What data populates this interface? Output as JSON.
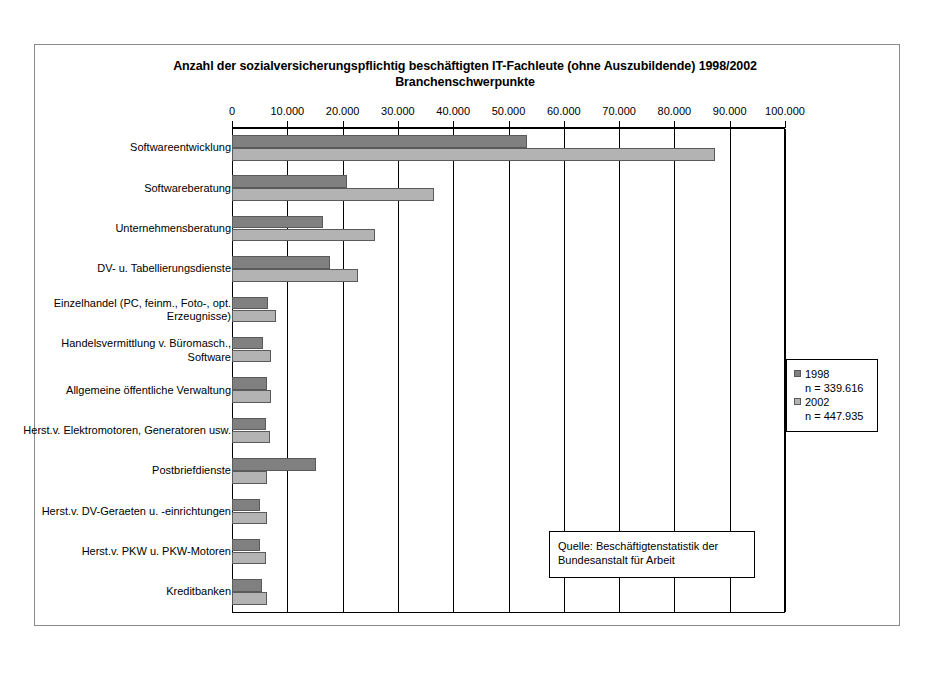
{
  "chart_data": {
    "type": "bar",
    "orientation": "horizontal",
    "title": "Anzahl der sozialversicherungspflichtig beschäftigten IT-Fachleute (ohne Auszubildende) 1998/2002",
    "subtitle": "Branchenschwerpunkte",
    "xlabel": "",
    "ylabel": "",
    "xlim": [
      0,
      100000
    ],
    "xtick_step": 10000,
    "grid": true,
    "tick_labels": [
      "0",
      "10.000",
      "20.000",
      "30.000",
      "40.000",
      "50.000",
      "60.000",
      "70.000",
      "80.000",
      "90.000",
      "100.000"
    ],
    "tick_values": [
      0,
      10000,
      20000,
      30000,
      40000,
      50000,
      60000,
      70000,
      80000,
      90000,
      100000
    ],
    "categories": [
      "Softwareentwicklung",
      "Softwareberatung",
      "Unternehmensberatung",
      "DV- u. Tabellierungsdienste",
      "Einzelhandel (PC, feinm., Foto-, opt. Erzeugnisse)",
      "Handelsvermittlung v. Büromasch., Software",
      "Allgemeine öffentliche Verwaltung",
      "Herst.v. Elektromotoren, Generatoren usw.",
      "Postbriefdienste",
      "Herst.v. DV-Geraeten u. -einrichtungen",
      "Herst.v. PKW u. PKW-Motoren",
      "Kreditbanken"
    ],
    "series": [
      {
        "name": "1998",
        "color": "#808080",
        "values": [
          53300,
          20800,
          16500,
          17700,
          6500,
          5600,
          6300,
          6100,
          15100,
          5100,
          5000,
          5500
        ]
      },
      {
        "name": "2002",
        "color": "#b3b3b3",
        "values": [
          87400,
          36500,
          25800,
          22700,
          8000,
          7000,
          7000,
          6800,
          6400,
          6400,
          6200,
          6300
        ]
      }
    ],
    "legend": {
      "position": "right",
      "entries": [
        {
          "label": "1998",
          "sublabel": "n = 339.616",
          "color": "#808080"
        },
        {
          "label": "2002",
          "sublabel": "n = 447.935",
          "color": "#b3b3b3"
        }
      ]
    },
    "annotations": [
      {
        "name": "source-note",
        "line1": "Quelle: Beschäftigtenstatistik der",
        "line2": "Bundesanstalt für Arbeit"
      }
    ]
  }
}
